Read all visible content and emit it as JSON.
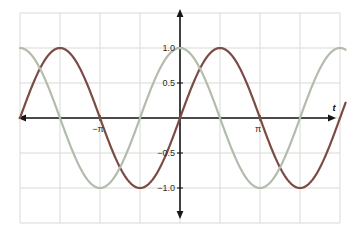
{
  "figure": {
    "background": "#ffffff",
    "grid_color": "#d9dbd6",
    "axis_color": "#161616",
    "tick_label_color": "#2a2a2a"
  },
  "chart_data": {
    "type": "line",
    "title": "",
    "xlabel": "t",
    "ylabel": "",
    "x_unit": "radians",
    "x_range_pi": [
      -2,
      2.07
    ],
    "y_range": [
      -1.5,
      1.5
    ],
    "grid": true,
    "grid_spacing": {
      "x_pi": 0.5,
      "y": 0.5
    },
    "x_ticks": [
      {
        "value_pi": -1,
        "label": "−π"
      },
      {
        "value_pi": 1,
        "label": "π"
      }
    ],
    "y_ticks": [
      {
        "value": 1.0,
        "label": "1.0"
      },
      {
        "value": 0.5,
        "label": "0.5"
      },
      {
        "value": -0.5,
        "label": "−0.5"
      },
      {
        "value": -1.0,
        "label": "−1.0"
      }
    ],
    "series": [
      {
        "name": "sin(t)",
        "function": "sin",
        "amplitude": 1,
        "period_pi": 2,
        "phase_pi": 0,
        "color": "#7b4b44",
        "width": 2.2,
        "sample_points_pi": [
          -2,
          -1.5,
          -1,
          -0.5,
          0,
          0.5,
          1,
          1.5,
          2
        ],
        "sample_values": [
          0,
          1,
          0,
          -1,
          0,
          1,
          0,
          -1,
          0
        ]
      },
      {
        "name": "cos(t)",
        "function": "cos",
        "amplitude": 1,
        "period_pi": 2,
        "phase_pi": 0,
        "color": "#b2bcac",
        "width": 2.2,
        "sample_points_pi": [
          -2,
          -1.5,
          -1,
          -0.5,
          0,
          0.5,
          1,
          1.5,
          2
        ],
        "sample_values": [
          1,
          0,
          -1,
          0,
          1,
          0,
          -1,
          0,
          1
        ]
      }
    ],
    "legend": null
  }
}
